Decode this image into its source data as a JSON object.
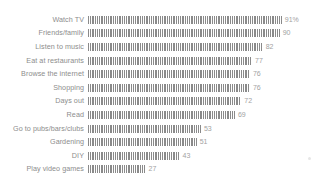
{
  "chart_data": {
    "type": "bar",
    "orientation": "horizontal",
    "title": "",
    "subtitle": "",
    "xlabel": "",
    "ylabel": "",
    "xlim": [
      0,
      100
    ],
    "grid": false,
    "legend": null,
    "categories": [
      "Watch TV",
      "Friends/family",
      "Listen to music",
      "Eat at restaurants",
      "Browse the internet",
      "Shopping",
      "Days out",
      "Read",
      "Go to pubs/bars/clubs",
      "Gardening",
      "DIY",
      "Play video games"
    ],
    "values": [
      91,
      90,
      82,
      77,
      76,
      76,
      72,
      69,
      53,
      51,
      43,
      27
    ],
    "value_labels": [
      "91%",
      "90",
      "82",
      "77",
      "76",
      "76",
      "72",
      "69",
      "53",
      "51",
      "43",
      "27"
    ],
    "units": "percent",
    "bar_color": "#8a8a8a",
    "bar_pattern": "vertical-stripes",
    "label_color": "#8d8d8d",
    "value_color": "#a2a2a2",
    "background_color": "#ffffff"
  },
  "rows": [
    {
      "label": "Watch TV",
      "value": 91,
      "value_label": "91%"
    },
    {
      "label": "Friends/family",
      "value": 90,
      "value_label": "90"
    },
    {
      "label": "Listen to music",
      "value": 82,
      "value_label": "82"
    },
    {
      "label": "Eat at restaurants",
      "value": 77,
      "value_label": "77"
    },
    {
      "label": "Browse the internet",
      "value": 76,
      "value_label": "76"
    },
    {
      "label": "Shopping",
      "value": 76,
      "value_label": "76"
    },
    {
      "label": "Days out",
      "value": 72,
      "value_label": "72"
    },
    {
      "label": "Read",
      "value": 69,
      "value_label": "69"
    },
    {
      "label": "Go to pubs/bars/clubs",
      "value": 53,
      "value_label": "53"
    },
    {
      "label": "Gardening",
      "value": 51,
      "value_label": "51"
    },
    {
      "label": "DIY",
      "value": 43,
      "value_label": "43"
    },
    {
      "label": "Play video games",
      "value": 27,
      "value_label": "27"
    }
  ],
  "scale": {
    "px_per_unit": 2.13
  }
}
